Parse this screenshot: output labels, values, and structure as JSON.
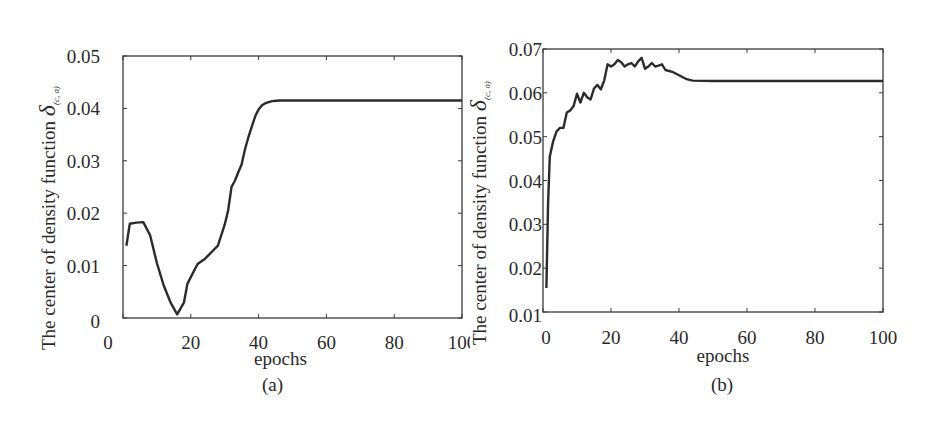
{
  "chart_data": [
    {
      "type": "line",
      "panel_label": "(a)",
      "title": "",
      "xlabel": "epochs",
      "ylabel": "The center of density function δ(c, σ)",
      "xlim": [
        0,
        100
      ],
      "ylim": [
        0,
        0.05
      ],
      "xticks": [
        "0",
        "20",
        "40",
        "60",
        "80",
        "100"
      ],
      "yticks": [
        "0",
        "0.01",
        "0.02",
        "0.03",
        "0.04",
        "0.05"
      ],
      "grid": false,
      "legend": null,
      "series": [
        {
          "name": "δ(c,σ)",
          "x": [
            1,
            2,
            4,
            6,
            8,
            10,
            12,
            14,
            16,
            18,
            19,
            20,
            22,
            24,
            26,
            28,
            30,
            31,
            32,
            33,
            34,
            35,
            36,
            37,
            38,
            39,
            40,
            41,
            42,
            44,
            46,
            50,
            60,
            80,
            100
          ],
          "y": [
            0.0138,
            0.018,
            0.0182,
            0.0183,
            0.0158,
            0.0105,
            0.0062,
            0.003,
            0.0007,
            0.003,
            0.0065,
            0.0078,
            0.0103,
            0.0112,
            0.0125,
            0.0138,
            0.0178,
            0.0205,
            0.025,
            0.0262,
            0.0278,
            0.0293,
            0.0322,
            0.0345,
            0.0365,
            0.0385,
            0.0398,
            0.0406,
            0.041,
            0.0414,
            0.0415,
            0.0415,
            0.0415,
            0.0415,
            0.0415
          ]
        }
      ]
    },
    {
      "type": "line",
      "panel_label": "(b)",
      "title": "",
      "xlabel": "epochs",
      "ylabel": "The center of density function δ(c, σ)",
      "xlim": [
        0,
        100
      ],
      "ylim": [
        0.01,
        0.07
      ],
      "xticks": [
        "0",
        "20",
        "40",
        "60",
        "80",
        "100"
      ],
      "yticks": [
        "0.01",
        "0.02",
        "0.03",
        "0.04",
        "0.05",
        "0.06",
        "0.07"
      ],
      "grid": false,
      "legend": null,
      "series": [
        {
          "name": "δ(c,σ)",
          "x": [
            1,
            1.5,
            2,
            3,
            4,
            5,
            6,
            7,
            8,
            9,
            10,
            11,
            12,
            13,
            14,
            15,
            16,
            17,
            18,
            19,
            20,
            21,
            22,
            23,
            24,
            25,
            26,
            27,
            28,
            29,
            30,
            31,
            32,
            33,
            34,
            35,
            36,
            38,
            40,
            42,
            44,
            50,
            60,
            80,
            100
          ],
          "y": [
            0.0155,
            0.035,
            0.0455,
            0.049,
            0.0512,
            0.052,
            0.052,
            0.0555,
            0.056,
            0.057,
            0.0598,
            0.0578,
            0.06,
            0.059,
            0.0585,
            0.061,
            0.0618,
            0.0608,
            0.0628,
            0.0665,
            0.066,
            0.0665,
            0.0675,
            0.067,
            0.066,
            0.0665,
            0.0668,
            0.066,
            0.0672,
            0.068,
            0.0655,
            0.066,
            0.0668,
            0.066,
            0.0662,
            0.0665,
            0.0652,
            0.0648,
            0.064,
            0.0632,
            0.0628,
            0.0627,
            0.0627,
            0.0627,
            0.0627
          ]
        }
      ]
    }
  ],
  "panels": {
    "a": {
      "caption": "(a)",
      "xlabel": "epochs",
      "ylabel_main": "The center of density function ",
      "ylabel_symbol": "δ",
      "ylabel_sub": "(c, σ)"
    },
    "b": {
      "caption": "(b)",
      "xlabel": "epochs",
      "ylabel_main": "The center of density function ",
      "ylabel_symbol": "δ",
      "ylabel_sub": "(c, σ)"
    }
  },
  "colors": {
    "line": "#2b2b2b",
    "axis": "#3a3a3a",
    "background": "#ffffff"
  }
}
